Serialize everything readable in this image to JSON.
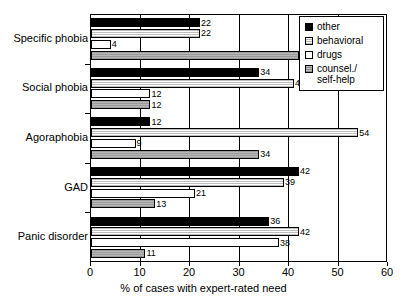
{
  "chart_data": {
    "type": "bar",
    "orientation": "horizontal",
    "title": "",
    "xlabel": "% of cases with expert-rated need",
    "ylabel": "",
    "xlim": [
      0,
      60
    ],
    "xticks": [
      0,
      10,
      20,
      30,
      40,
      50,
      60
    ],
    "xticklabels": [
      "0",
      "10",
      "20",
      "30",
      "40",
      "50",
      "60"
    ],
    "grid": true,
    "grid_axis": "x",
    "legend_position": "top-right",
    "categories": [
      "Specific phobia",
      "Social phobia",
      "Agoraphobia",
      "GAD",
      "Panic disorder"
    ],
    "series": [
      {
        "name": "other",
        "swatch": "#000000",
        "pattern": "solid-black",
        "values": [
          22,
          34,
          12,
          42,
          36
        ]
      },
      {
        "name": "behavioral",
        "swatch": "#e8e8e8",
        "pattern": "fine-dotted",
        "values": [
          22,
          41,
          54,
          39,
          42
        ]
      },
      {
        "name": "drugs",
        "swatch": "#ffffff",
        "pattern": "empty",
        "values": [
          4,
          12,
          9,
          21,
          38
        ]
      },
      {
        "name": "counsel./ self-help",
        "swatch": "#aaaaaa",
        "pattern": "gray-hatch",
        "values": [
          42,
          12,
          34,
          13,
          11
        ]
      }
    ]
  },
  "legend": {
    "entries": [
      {
        "label": "other"
      },
      {
        "label": "behavioral"
      },
      {
        "label": "drugs"
      },
      {
        "label": "counsel./"
      },
      {
        "label": "self-help"
      }
    ]
  }
}
